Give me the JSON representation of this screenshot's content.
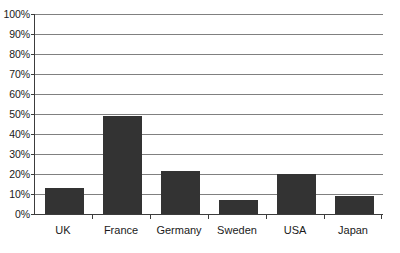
{
  "chart_data": {
    "type": "bar",
    "title": "",
    "subtitle": "",
    "xlabel": "",
    "ylabel": "",
    "categories": [
      "UK",
      "France",
      "Germany",
      "Sweden",
      "USA",
      "Japan"
    ],
    "values": [
      13,
      49,
      21.5,
      7,
      20,
      9
    ],
    "value_unit": "%",
    "ylim": [
      0,
      100
    ],
    "ytick_values": [
      0,
      10,
      20,
      30,
      40,
      50,
      60,
      70,
      80,
      90,
      100
    ],
    "ytick_labels": [
      "0%",
      "10%",
      "20%",
      "30%",
      "40%",
      "50%",
      "60%",
      "70%",
      "80%",
      "90%",
      "100%"
    ],
    "grid": true,
    "grid_axis": "y",
    "legend": false,
    "legend_position": "none",
    "series": [
      {
        "name": "",
        "values": [
          13,
          49,
          21.5,
          7,
          20,
          9
        ]
      }
    ],
    "colors": {
      "bar": "#333333",
      "gridline": "#808080",
      "axis": "#3c3c3c",
      "background": "#ffffff",
      "text": "#1a1a1a"
    }
  }
}
